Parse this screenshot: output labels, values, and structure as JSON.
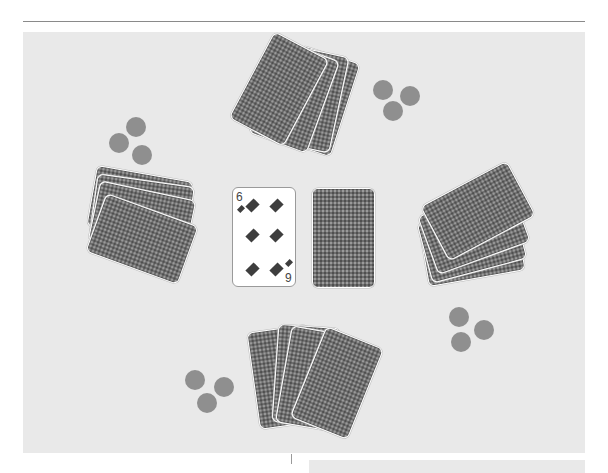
{
  "game": {
    "name": "card-table",
    "colors": {
      "table": "#e9e9e9",
      "card_back": "#6e6e6e",
      "card_border": "#ffffff",
      "chip": "#8f8f8f",
      "suit": "#3e3e3e"
    },
    "center": {
      "face_card": {
        "rank": "6",
        "rank_flipped": "9",
        "suit": "diamonds",
        "pips": 6
      },
      "deck_card": {
        "face_down": true
      }
    },
    "players": [
      {
        "position": "top",
        "cards_in_hand": 4,
        "chips": 3
      },
      {
        "position": "left",
        "cards_in_hand": 4,
        "chips": 3
      },
      {
        "position": "right",
        "cards_in_hand": 4,
        "chips": 3
      },
      {
        "position": "bottom",
        "cards_in_hand": 4,
        "chips": 3
      }
    ]
  }
}
